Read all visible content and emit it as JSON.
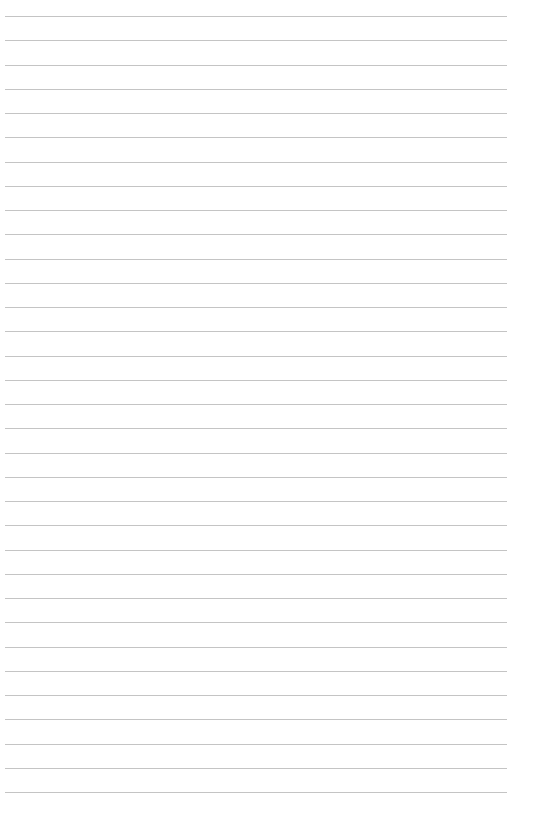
{
  "page": {
    "type": "lined-paper",
    "background_color": "#ffffff",
    "rule_color": "#c4c4c4",
    "rule_count": 33,
    "first_rule_y": 16,
    "rule_spacing": 24.25,
    "rule_left": 5,
    "rule_width": 502
  }
}
